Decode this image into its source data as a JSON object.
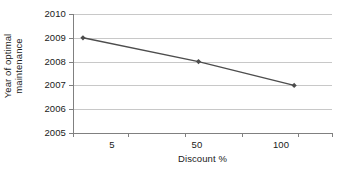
{
  "chart_data": {
    "type": "line",
    "title": "",
    "subtitle": "",
    "xlabel": "Discount %",
    "ylabel": "Year of optimal maintenance",
    "ylabel_line1": "Year of optimal",
    "ylabel_line2": "maintenance",
    "x": [
      5,
      63,
      111
    ],
    "values": [
      2009,
      2008,
      2007
    ],
    "series": [
      {
        "name": "Year of optimal maintenance",
        "values": [
          2009,
          2008,
          2007
        ]
      }
    ],
    "points": [
      {
        "x": 5,
        "y": 2009
      },
      {
        "x": 63,
        "y": 2008
      },
      {
        "x": 111,
        "y": 2007
      }
    ],
    "xtick_labels": [
      "5",
      "50",
      "100"
    ],
    "xtick_values": [
      5,
      50,
      100
    ],
    "ytick_labels": [
      "2005",
      "2006",
      "2007",
      "2008",
      "2009",
      "2010"
    ],
    "ytick_values": [
      2005,
      2006,
      2007,
      2008,
      2009,
      2010
    ],
    "xlim": [
      0,
      130
    ],
    "ylim": [
      2005,
      2010
    ],
    "grid": "horizontal",
    "legend": "none",
    "line_color": "#4d4d4d",
    "marker_color": "#4d4d4d",
    "marker_shape": "diamond",
    "grid_color": "#c8c8c8",
    "axis_color": "#808080",
    "background": "#ffffff"
  }
}
